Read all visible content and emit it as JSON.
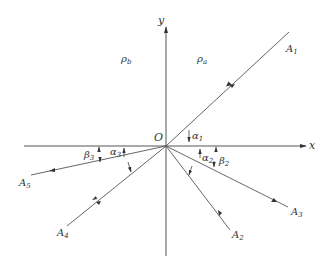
{
  "figure": {
    "axes": {
      "x_label": "x",
      "y_label": "y",
      "origin_label": "O"
    },
    "regions": {
      "left_density": "ρ",
      "left_density_sub": "b",
      "right_density": "ρ",
      "right_density_sub": "a"
    },
    "rays": [
      {
        "label": "A",
        "sub": "1",
        "direction": "incoming"
      },
      {
        "label": "A",
        "sub": "2",
        "direction": "outgoing"
      },
      {
        "label": "A",
        "sub": "3",
        "direction": "outgoing"
      },
      {
        "label": "A",
        "sub": "4",
        "direction": "outgoing"
      },
      {
        "label": "A",
        "sub": "5",
        "direction": "outgoing"
      }
    ],
    "angles": [
      {
        "label": "α",
        "sub": "1"
      },
      {
        "label": "α",
        "sub": "2"
      },
      {
        "label": "β",
        "sub": "2"
      },
      {
        "label": "α",
        "sub": "3"
      },
      {
        "label": "β",
        "sub": "3"
      }
    ],
    "colors": {
      "line": "#555555",
      "text": "#333333",
      "background": "#ffffff"
    }
  }
}
